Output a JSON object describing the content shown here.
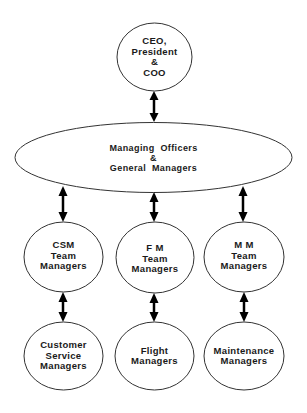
{
  "diagram": {
    "type": "organizational-hierarchy",
    "stroke_color": "#333333",
    "arrow_color": "#000000",
    "nodes": {
      "ceo": {
        "lines": [
          "CEO,",
          "President",
          "&",
          "COO"
        ]
      },
      "managing": {
        "lines": [
          "Managing  Officers",
          "&",
          "General  Managers"
        ]
      },
      "csm_team": {
        "lines": [
          "CSM",
          "Team",
          "Managers"
        ]
      },
      "fm_team": {
        "lines": [
          "F M",
          "Team",
          "Managers"
        ]
      },
      "mm_team": {
        "lines": [
          "M M",
          "Team",
          "Managers"
        ]
      },
      "customer_service": {
        "lines": [
          "Customer",
          "Service",
          "Managers"
        ]
      },
      "flight": {
        "lines": [
          "Flight",
          "Managers"
        ]
      },
      "maintenance": {
        "lines": [
          "Maintenance",
          "Managers"
        ]
      }
    },
    "connections": [
      {
        "from": "ceo",
        "to": "managing",
        "type": "bidirectional-arrow"
      },
      {
        "from": "managing",
        "to": "csm_team",
        "type": "bidirectional-arrow"
      },
      {
        "from": "managing",
        "to": "fm_team",
        "type": "bidirectional-arrow"
      },
      {
        "from": "managing",
        "to": "mm_team",
        "type": "bidirectional-arrow"
      },
      {
        "from": "csm_team",
        "to": "customer_service",
        "type": "bidirectional-arrow"
      },
      {
        "from": "fm_team",
        "to": "flight",
        "type": "bidirectional-arrow"
      },
      {
        "from": "mm_team",
        "to": "maintenance",
        "type": "bidirectional-arrow"
      }
    ]
  }
}
